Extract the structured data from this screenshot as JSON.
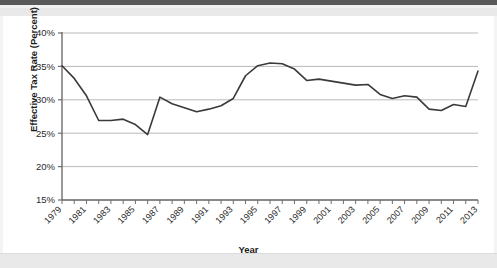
{
  "chart_data": {
    "type": "line",
    "title": "",
    "xlabel": "Year",
    "ylabel": "Effective Tax Rate (Percent)",
    "ylim": [
      15,
      40
    ],
    "xlim": [
      1979,
      2013
    ],
    "ytick_labels": [
      "40%",
      "35%",
      "30%",
      "25%",
      "20%",
      "15%"
    ],
    "ytick_values": [
      40,
      35,
      30,
      25,
      20,
      15
    ],
    "grid": true,
    "grid_axis": "y",
    "legend": "none",
    "xtick_labels": [
      "1979",
      "1981",
      "1983",
      "1985",
      "1987",
      "1989",
      "1991",
      "1993",
      "1995",
      "1997",
      "1999",
      "2001",
      "2003",
      "2005",
      "2007",
      "2009",
      "2011",
      "2013"
    ],
    "xtick_values": [
      1979,
      1981,
      1983,
      1985,
      1987,
      1989,
      1991,
      1993,
      1995,
      1997,
      1999,
      2001,
      2003,
      2005,
      2007,
      2009,
      2011,
      2013
    ],
    "minor_ticks_every": 1,
    "line_color": "#3a3a3a",
    "line_width": 1.6,
    "x": [
      1979,
      1980,
      1981,
      1982,
      1983,
      1984,
      1985,
      1986,
      1987,
      1988,
      1989,
      1990,
      1991,
      1992,
      1993,
      1994,
      1995,
      1996,
      1997,
      1998,
      1999,
      2000,
      2001,
      2002,
      2003,
      2004,
      2005,
      2006,
      2007,
      2008,
      2009,
      2010,
      2011,
      2012,
      2013
    ],
    "values": [
      35.1,
      33.2,
      30.6,
      26.9,
      26.9,
      27.1,
      26.3,
      24.8,
      30.4,
      29.4,
      28.8,
      28.2,
      28.6,
      29.1,
      30.2,
      33.6,
      35.1,
      35.5,
      35.4,
      34.6,
      32.9,
      33.1,
      32.8,
      32.5,
      32.2,
      32.3,
      30.8,
      30.2,
      30.6,
      30.4,
      28.6,
      28.4,
      29.3,
      29.0,
      34.3
    ],
    "series_name": "Effective Tax Rate"
  },
  "axes": {
    "x_title": "Year",
    "y_title": "Effective Tax Rate (Percent)"
  }
}
